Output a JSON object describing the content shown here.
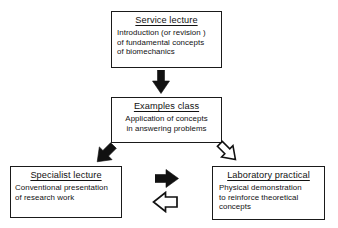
{
  "diagram": {
    "type": "flowchart",
    "background_color": "#ffffff",
    "stroke_color": "#1a1a1a",
    "nodes": [
      {
        "id": "service",
        "title": "Service lecture",
        "body": [
          "Introduction (or revision )",
          "of fundamental concepts",
          "of biomechanics"
        ]
      },
      {
        "id": "examples",
        "title": "Examples class",
        "body": [
          "Application of concepts",
          "in answering problems"
        ]
      },
      {
        "id": "specialist",
        "title": "Specialist lecture",
        "body": [
          "Conventional presentation",
          "of research work"
        ]
      },
      {
        "id": "laboratory",
        "title": "Laboratory practical",
        "body": [
          "Physical demonstration",
          "to reinforce theoretical",
          "concepts"
        ]
      }
    ],
    "arrows": [
      {
        "id": "service-to-examples",
        "from": "service",
        "to": "examples",
        "direction": "down",
        "style": "solid",
        "fill": "#111111"
      },
      {
        "id": "examples-to-specialist",
        "from": "examples",
        "to": "specialist",
        "direction": "down-left",
        "style": "solid",
        "fill": "#111111"
      },
      {
        "id": "examples-to-laboratory",
        "from": "examples",
        "to": "laboratory",
        "direction": "down-right",
        "style": "outline",
        "fill": "#ffffff"
      },
      {
        "id": "specialist-to-laboratory",
        "from": "specialist",
        "to": "laboratory",
        "direction": "right",
        "style": "solid",
        "fill": "#111111"
      },
      {
        "id": "laboratory-to-specialist",
        "from": "laboratory",
        "to": "specialist",
        "direction": "left",
        "style": "outline",
        "fill": "#ffffff"
      }
    ]
  }
}
